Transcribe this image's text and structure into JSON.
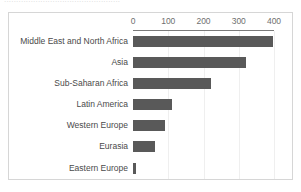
{
  "title_sliver": "................................................",
  "chart_frame": {
    "border_color": "#d6d6d6",
    "background": "#ffffff"
  },
  "chart_data": {
    "type": "bar",
    "orientation": "horizontal",
    "title": "",
    "subtitle": "",
    "xlabel": "",
    "ylabel": "",
    "categories": [
      "Middle East and North Africa",
      "Asia",
      "Sub-Saharan Africa",
      "Latin America",
      "Western Europe",
      "Eurasia",
      "Eastern Europe"
    ],
    "values": [
      397,
      320,
      220,
      111,
      91,
      63,
      9
    ],
    "tick_labels": [
      "0",
      "100",
      "200",
      "300",
      "400"
    ],
    "ticks": [
      0,
      100,
      200,
      300,
      400
    ],
    "xlim": [
      0,
      400
    ],
    "grid": false,
    "legend": "none",
    "bar_color": "#595959",
    "axis_color": "#7a7a7a",
    "tick_label_color": "#6f6f6f",
    "category_label_color": "#4a4a4a"
  }
}
